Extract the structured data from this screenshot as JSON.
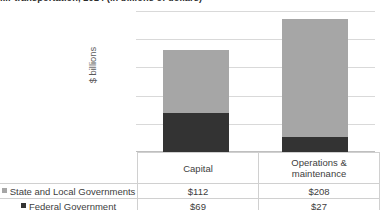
{
  "chart_data": {
    "type": "bar",
    "subtype": "stacked-column",
    "title_visible_fragment": "...r transportation, 2014 (in billions of dollars)",
    "xlabel": "",
    "ylabel": "$ billions",
    "categories": [
      "Capital",
      "Operations & maintenance"
    ],
    "series": [
      {
        "name": "State and Local Governments",
        "values": [
          112,
          208
        ],
        "color": "#a6a6a6",
        "stack_position": "top"
      },
      {
        "name": "Federal Government",
        "values": [
          69,
          27
        ],
        "color": "#333333",
        "stack_position": "bottom"
      }
    ],
    "totals": [
      181,
      235
    ],
    "ylim": [
      0,
      250
    ],
    "yticks": [
      0,
      50,
      100,
      150,
      200,
      250
    ],
    "ytick_labels": [
      "$-",
      "$50",
      "$100",
      "$150",
      "$200",
      "$250"
    ],
    "grid": true,
    "legend_position": "data-table-row-labels",
    "value_prefix": "$",
    "data_table": {
      "row_header_blank": "",
      "column_headers": [
        "Capital",
        "Operations & maintenance"
      ],
      "column_header_lines": [
        [
          "Capital"
        ],
        [
          "Operations &",
          "maintenance"
        ]
      ],
      "rows": [
        {
          "label": "State and Local Governments",
          "swatch": "#a6a6a6",
          "values": [
            "$112",
            "$208"
          ]
        },
        {
          "label": "Federal Government",
          "swatch": "#333333",
          "values": [
            "$69",
            "$27"
          ]
        }
      ]
    }
  },
  "colors": {
    "series_light": "#a6a6a6",
    "series_dark": "#333333",
    "gridline": "#d9d9d9",
    "table_border": "#d0d0d0",
    "text": "#404040",
    "axis_text": "#595959"
  }
}
